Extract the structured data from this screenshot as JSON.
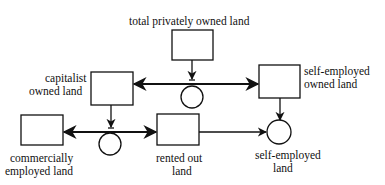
{
  "diagram": {
    "colors": {
      "stroke": "#111111",
      "background": "#ffffff"
    },
    "stocks": [
      {
        "id": "total",
        "label": [
          "total privately owned land"
        ]
      },
      {
        "id": "capitalist",
        "label": [
          "capitalist",
          "owned land"
        ]
      },
      {
        "id": "selfowned",
        "label": [
          "self-employed",
          "owned land"
        ]
      },
      {
        "id": "commercial",
        "label": [
          "commercially",
          "employed land"
        ]
      },
      {
        "id": "rented",
        "label": [
          "rented out",
          "land"
        ]
      }
    ],
    "auxiliaries": [
      {
        "id": "split1",
        "label": ""
      },
      {
        "id": "split2",
        "label": ""
      },
      {
        "id": "selfemployed",
        "label": [
          "self-employed",
          "land"
        ]
      }
    ],
    "labels": {
      "total": "total privately owned land",
      "capitalist_1": "capitalist",
      "capitalist_2": "owned land",
      "selfowned_1": "self-employed",
      "selfowned_2": "owned land",
      "commercial_1": "commercially",
      "commercial_2": "employed land",
      "rented_1": "rented out",
      "rented_2": "land",
      "selfemployed_1": "self-employed",
      "selfemployed_2": "land"
    }
  }
}
